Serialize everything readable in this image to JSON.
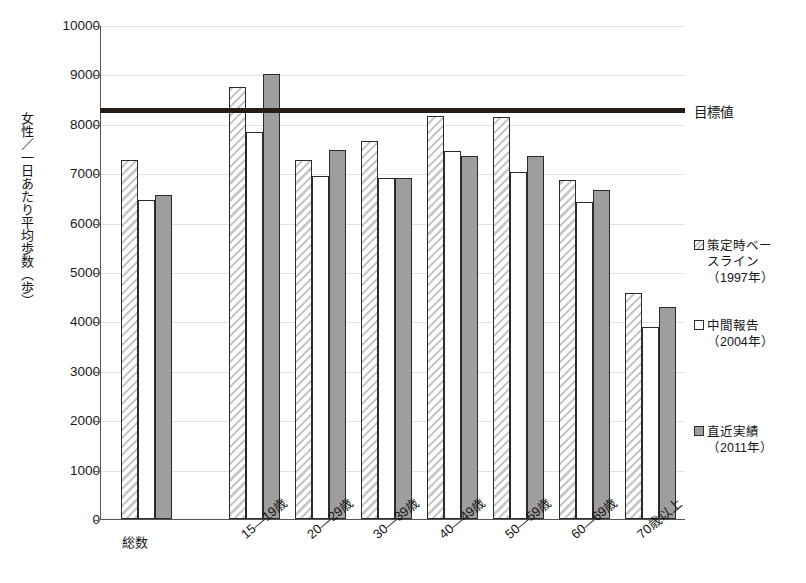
{
  "chart_data": {
    "type": "bar",
    "title": "",
    "xlabel": "",
    "ylabel": "女性／一日あたり平均歩数（歩）",
    "ylim": [
      0,
      10000
    ],
    "ytick_step": 1000,
    "grid": true,
    "legend_position": "right",
    "categories": [
      "総数",
      "15—19歳",
      "20—29歳",
      "30—39歳",
      "40—49歳",
      "50—59歳",
      "60—69歳",
      "70歳以上"
    ],
    "ytick_labels": [
      "0",
      "1000",
      "2000",
      "3000",
      "4000",
      "5000",
      "6000",
      "7000",
      "8000",
      "9000",
      "10000"
    ],
    "series": [
      {
        "name": "策定時ベースライン（1997年）",
        "style": "hatched",
        "values": [
          7270,
          8750,
          7270,
          7650,
          8160,
          8140,
          6860,
          4570
        ]
      },
      {
        "name": "中間報告（2004年）",
        "style": "white",
        "values": [
          6450,
          7830,
          6950,
          6910,
          7450,
          7030,
          6410,
          3880
        ]
      },
      {
        "name": "直近実績（2011年）",
        "style": "gray",
        "values": [
          6560,
          9010,
          7470,
          6910,
          7340,
          7340,
          6670,
          4290
        ]
      }
    ],
    "reference_line": {
      "label": "目標値",
      "value": 8300,
      "color": "#241c16"
    }
  },
  "legend": [
    {
      "line1": "策定時ベー",
      "line2": "スライン",
      "line3": "（1997年）",
      "swatch": "hatched-swatch"
    },
    {
      "line1": "中間報告",
      "line2": "（2004年）",
      "line3": "",
      "swatch": "white-swatch"
    },
    {
      "line1": "直近実績",
      "line2": "（2011年）",
      "line3": "",
      "swatch": "gray-swatch"
    }
  ],
  "axis": {
    "y_title": "女性／一日あたり平均歩数（歩）"
  }
}
